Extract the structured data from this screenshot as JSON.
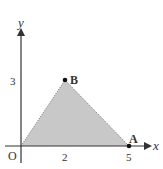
{
  "diagram": {
    "axes": {
      "x_label": "x",
      "y_label": "y",
      "origin_label": "O",
      "x_ticks": [
        "2",
        "5"
      ],
      "y_ticks": [
        "3"
      ]
    },
    "points": [
      {
        "name": "A",
        "x": 5,
        "y": 0
      },
      {
        "name": "B",
        "x": 2,
        "y": 3
      }
    ],
    "region": {
      "vertices": [
        [
          0,
          0
        ],
        [
          2,
          3
        ],
        [
          5,
          0
        ]
      ],
      "fill": "#c8c8c8",
      "edge_style": "dotted"
    },
    "colors": {
      "axis": "#333333",
      "fill": "#c8c8c8",
      "point": "#111111"
    }
  }
}
